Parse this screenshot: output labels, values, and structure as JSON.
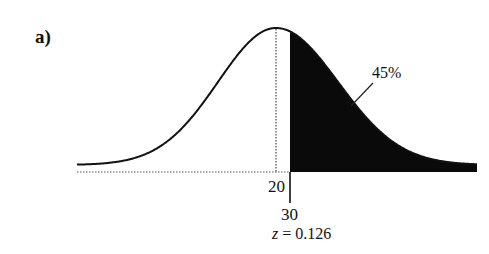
{
  "chart_data": {
    "type": "area",
    "title": "",
    "panel_label": "a)",
    "distribution": "normal",
    "mean": 20,
    "shaded_region": {
      "from": 30,
      "to": "+inf",
      "side": "right"
    },
    "shaded_area_label": "45%",
    "shaded_area": 0.45,
    "ticks": [
      {
        "value": 20,
        "label": "20",
        "line_style": "dotted"
      },
      {
        "value": 30,
        "label": "30",
        "line_style": "solid"
      }
    ],
    "z_annotation": {
      "variable": "z",
      "equals": "=",
      "value": "0.126"
    },
    "xlabel": "",
    "ylabel": "",
    "grid": false,
    "legend": null
  },
  "labels": {
    "panel": "a)",
    "mean_tick": "20",
    "cutoff_tick": "30",
    "z_var": "z",
    "z_eq": " = 0.126",
    "pct": "45%"
  },
  "colors": {
    "curve": "#111111",
    "shade": "#0a0a0a",
    "baseline": "#555555",
    "background": "#ffffff"
  }
}
